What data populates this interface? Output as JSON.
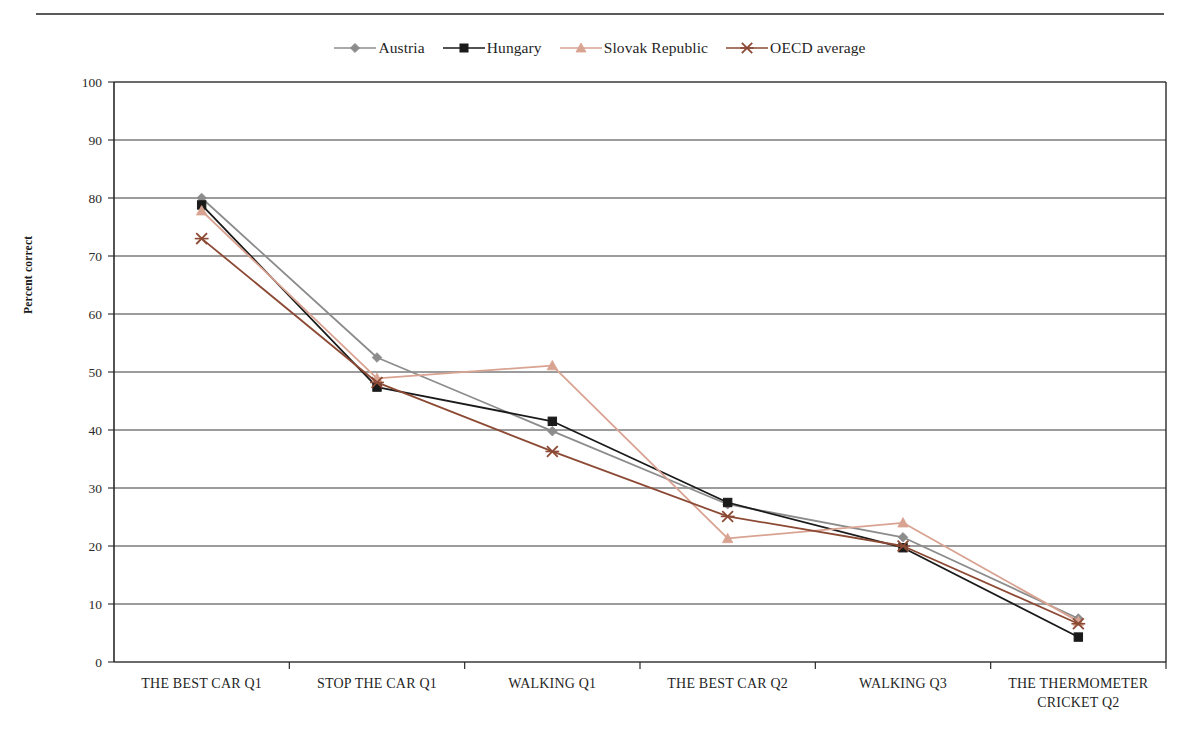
{
  "figure": {
    "top_rule": true,
    "background": "#ffffff"
  },
  "legend": {
    "position": "top-center",
    "entries": [
      {
        "label": "Austria",
        "color": "#8c8c8c",
        "marker": "diamond"
      },
      {
        "label": "Hungary",
        "color": "#1a1a1a",
        "marker": "square"
      },
      {
        "label": "Slovak Republic",
        "color": "#d9a391",
        "marker": "triangle"
      },
      {
        "label": "OECD average",
        "color": "#8c4a35",
        "marker": "cross"
      }
    ]
  },
  "axes": {
    "ylabel": "Percent correct",
    "yticks": [
      0,
      10,
      20,
      30,
      40,
      50,
      60,
      70,
      80,
      90,
      100
    ],
    "ylim": [
      0,
      100
    ],
    "grid": "horizontal",
    "xlabel": ""
  },
  "chart_data": {
    "type": "line",
    "title": "",
    "xlabel": "",
    "ylabel": "Percent correct",
    "ylim": [
      0,
      100
    ],
    "grid": true,
    "legend_position": "top-center",
    "categories": [
      "THE BEST CAR Q1",
      "STOP THE CAR Q1",
      "WALKING Q1",
      "THE BEST CAR Q2",
      "WALKING Q3",
      "THE THERMOMETER CRICKET Q2"
    ],
    "category_lines": [
      [
        "THE BEST CAR Q1"
      ],
      [
        "STOP THE CAR Q1"
      ],
      [
        "WALKING Q1"
      ],
      [
        "THE BEST CAR Q2"
      ],
      [
        "WALKING Q3"
      ],
      [
        "THE THERMOMETER",
        "CRICKET Q2"
      ]
    ],
    "series": [
      {
        "name": "Austria",
        "color": "#8c8c8c",
        "marker": "diamond",
        "values": [
          80.0,
          52.5,
          39.8,
          27.2,
          21.5,
          7.5
        ]
      },
      {
        "name": "Hungary",
        "color": "#1a1a1a",
        "marker": "square",
        "values": [
          78.8,
          47.4,
          41.5,
          27.5,
          19.7,
          4.3
        ]
      },
      {
        "name": "Slovak Republic",
        "color": "#d9a391",
        "marker": "triangle",
        "values": [
          77.8,
          48.9,
          51.1,
          21.3,
          24.0,
          7.0
        ]
      },
      {
        "name": "OECD average",
        "color": "#8c4a35",
        "marker": "cross",
        "values": [
          73.0,
          48.2,
          36.3,
          25.1,
          20.0,
          6.6
        ]
      }
    ]
  },
  "plot_geometry": {
    "left": 114,
    "right": 1166,
    "top": 82,
    "bottom": 662
  }
}
